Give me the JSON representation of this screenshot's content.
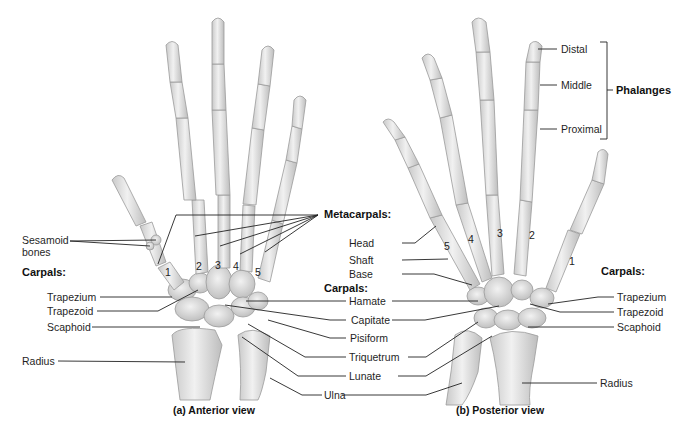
{
  "figure": {
    "panels": [
      {
        "id": "anterior",
        "caption": "(a) Anterior view"
      },
      {
        "id": "posterior",
        "caption": "(b) Posterior view"
      }
    ]
  },
  "anterior": {
    "sesamoid": "Sesamoid\nbones",
    "sesamoid_l1": "Sesamoid",
    "sesamoid_l2": "bones",
    "carpals_heading": "Carpals:",
    "trapezium": "Trapezium",
    "trapezoid": "Trapezoid",
    "scaphoid": "Scaphoid",
    "radius": "Radius",
    "metacarpal_numbers": [
      "1",
      "2",
      "3",
      "4",
      "5"
    ]
  },
  "center": {
    "metacarpals_heading": "Metacarpals:",
    "carpals_heading": "Carpals:",
    "head": "Head",
    "shaft": "Shaft",
    "base": "Base",
    "hamate": "Hamate",
    "capitate": "Capitate",
    "pisiform": "Pisiform",
    "triquetrum": "Triquetrum",
    "lunate": "Lunate",
    "ulna": "Ulna"
  },
  "posterior": {
    "distal": "Distal",
    "middle": "Middle",
    "proximal": "Proximal",
    "phalanges_heading": "Phalanges",
    "carpals_heading": "Carpals:",
    "trapezium": "Trapezium",
    "trapezoid": "Trapezoid",
    "scaphoid": "Scaphoid",
    "radius": "Radius",
    "metacarpal_numbers": [
      "5",
      "4",
      "3",
      "2",
      "1"
    ]
  }
}
